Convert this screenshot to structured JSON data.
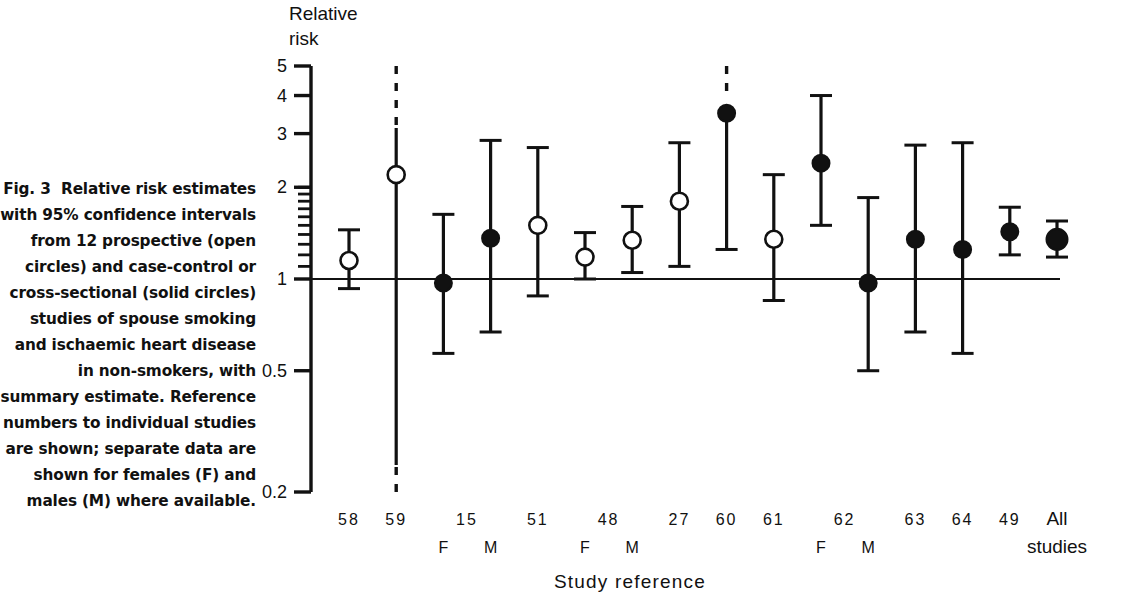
{
  "figure": {
    "label": "Fig. 3",
    "caption": "Relative risk estimates with 95% confidence intervals from 12 prospective (open circles) and case-control or cross-sectional (solid circles) studies of spouse smoking and ischaemic heart disease in non-smokers, with summary estimate. Reference numbers to individual studies are shown; separate data are shown for females (F) and males (M) where available."
  },
  "chart_data": {
    "type": "scatter",
    "title": "",
    "ylabel": "Relative risk",
    "xlabel": "Study reference",
    "yscale": "log",
    "ylim": [
      0.2,
      5
    ],
    "ytick_labels": [
      "5",
      "4",
      "3",
      "2",
      "1",
      "0.5",
      "0.2"
    ],
    "ytick_values": [
      5,
      4,
      3,
      2,
      1,
      0.5,
      0.2
    ],
    "minor_ticks": [
      1.1,
      1.2,
      1.3,
      1.4,
      1.5,
      1.6,
      1.7,
      1.8,
      1.9,
      2.0
    ],
    "reference_line": 1,
    "grid": false,
    "legend": [
      "open circles = prospective",
      "solid circles = case-control or cross-sectional"
    ],
    "categories": [
      "58",
      "59",
      "15 F",
      "15 M",
      "51",
      "48 F",
      "48 M",
      "27",
      "60",
      "61",
      "62 F",
      "62 M",
      "63",
      "64",
      "49",
      "All studies"
    ],
    "points": [
      {
        "label": "58",
        "sub": "",
        "rr": 1.15,
        "lo": 0.93,
        "hi": 1.45,
        "marker": "open",
        "lo_open": false,
        "hi_open": false
      },
      {
        "label": "59",
        "sub": "",
        "rr": 2.2,
        "lo": 0.22,
        "hi": 4.6,
        "marker": "open",
        "lo_open": true,
        "hi_open": true
      },
      {
        "label": "15",
        "sub": "F",
        "rr": 0.97,
        "lo": 0.57,
        "hi": 1.63,
        "marker": "solid",
        "lo_open": false,
        "hi_open": false
      },
      {
        "label": "",
        "sub": "M",
        "rr": 1.36,
        "lo": 0.67,
        "hi": 2.85,
        "marker": "solid",
        "lo_open": false,
        "hi_open": false
      },
      {
        "label": "51",
        "sub": "",
        "rr": 1.5,
        "lo": 0.88,
        "hi": 2.7,
        "marker": "open",
        "lo_open": false,
        "hi_open": false
      },
      {
        "label": "48",
        "sub": "F",
        "rr": 1.18,
        "lo": 1.0,
        "hi": 1.42,
        "marker": "open",
        "lo_open": false,
        "hi_open": false
      },
      {
        "label": "",
        "sub": "M",
        "rr": 1.34,
        "lo": 1.05,
        "hi": 1.73,
        "marker": "open",
        "lo_open": false,
        "hi_open": false
      },
      {
        "label": "27",
        "sub": "",
        "rr": 1.8,
        "lo": 1.1,
        "hi": 2.8,
        "marker": "open",
        "lo_open": false,
        "hi_open": false
      },
      {
        "label": "60",
        "sub": "",
        "rr": 3.5,
        "lo": 1.25,
        "hi": 5.2,
        "marker": "solid",
        "lo_open": false,
        "hi_open": true
      },
      {
        "label": "61",
        "sub": "",
        "rr": 1.35,
        "lo": 0.85,
        "hi": 2.2,
        "marker": "open",
        "lo_open": false,
        "hi_open": false
      },
      {
        "label": "62",
        "sub": "F",
        "rr": 2.4,
        "lo": 1.5,
        "hi": 4.0,
        "marker": "solid",
        "lo_open": false,
        "hi_open": false
      },
      {
        "label": "",
        "sub": "M",
        "rr": 0.97,
        "lo": 0.5,
        "hi": 1.85,
        "marker": "solid",
        "lo_open": false,
        "hi_open": false
      },
      {
        "label": "63",
        "sub": "",
        "rr": 1.35,
        "lo": 0.67,
        "hi": 2.75,
        "marker": "solid",
        "lo_open": false,
        "hi_open": false
      },
      {
        "label": "64",
        "sub": "",
        "rr": 1.25,
        "lo": 0.57,
        "hi": 2.8,
        "marker": "solid",
        "lo_open": false,
        "hi_open": false
      },
      {
        "label": "49",
        "sub": "",
        "rr": 1.43,
        "lo": 1.2,
        "hi": 1.72,
        "marker": "solid",
        "lo_open": false,
        "hi_open": false
      },
      {
        "label": "All studies",
        "sub": "",
        "rr": 1.35,
        "lo": 1.18,
        "hi": 1.55,
        "marker": "solid-large",
        "lo_open": false,
        "hi_open": false
      }
    ]
  },
  "colors": {
    "ink": "#111111",
    "background": "#ffffff"
  }
}
